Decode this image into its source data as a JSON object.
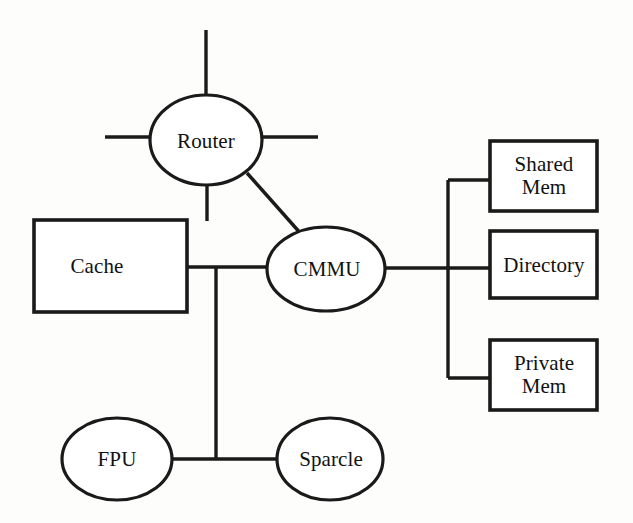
{
  "diagram": {
    "background_color": "#fdfdfc",
    "stroke_color": "#1a1a1a",
    "nodes": [
      {
        "id": "router",
        "label": "Router",
        "shape": "ellipse",
        "cx": 206,
        "cy": 140,
        "rx": 56,
        "ry": 45
      },
      {
        "id": "cmmu",
        "label": "CMMU",
        "shape": "ellipse",
        "cx": 326,
        "cy": 269,
        "rx": 59,
        "ry": 42
      },
      {
        "id": "fpu",
        "label": "FPU",
        "shape": "ellipse",
        "cx": 117,
        "cy": 459,
        "rx": 55,
        "ry": 41
      },
      {
        "id": "sparcle",
        "label": "Sparcle",
        "shape": "ellipse",
        "cx": 330,
        "cy": 459,
        "rx": 53,
        "ry": 41
      },
      {
        "id": "cache",
        "label": "Cache",
        "shape": "rect",
        "x": 34,
        "y": 220,
        "width": 153,
        "height": 92
      },
      {
        "id": "shared-mem",
        "label": "Shared\nMem",
        "shape": "rect",
        "x": 490,
        "y": 141,
        "width": 107,
        "height": 70
      },
      {
        "id": "directory",
        "label": "Directory",
        "shape": "rect",
        "x": 490,
        "y": 231,
        "width": 107,
        "height": 67
      },
      {
        "id": "private-mem",
        "label": "Private\nMem",
        "shape": "rect",
        "x": 490,
        "y": 340,
        "width": 107,
        "height": 70
      }
    ],
    "links": [
      {
        "id": "router-north-spoke",
        "from": "router",
        "to": "network-north",
        "path": "M 206 30 L 206 96"
      },
      {
        "id": "router-west-spoke",
        "from": "router",
        "to": "network-west",
        "path": "M 105 137 L 153 137"
      },
      {
        "id": "router-east-spoke",
        "from": "router",
        "to": "network-east",
        "path": "M 259 137 L 318 137"
      },
      {
        "id": "router-south-spoke",
        "from": "router",
        "to": "network-south",
        "path": "M 207 182 L 207 221"
      },
      {
        "id": "router-cmmu",
        "from": "router",
        "to": "cmmu",
        "path": "M 247 173 L 302 235"
      },
      {
        "id": "cache-cmmu",
        "from": "cache",
        "to": "cmmu",
        "path": "M 187 267 L 268 267"
      },
      {
        "id": "cmmu-bus",
        "from": "cmmu",
        "to": "memory-bus",
        "path": "M 385 268 L 490 268"
      },
      {
        "id": "memory-bus-trunk",
        "from": "memory-bus",
        "to": "memory-bus",
        "path": "M 448 180 L 448 378"
      },
      {
        "id": "bus-shared-mem",
        "from": "memory-bus",
        "to": "shared-mem",
        "path": "M 448 180 L 490 180"
      },
      {
        "id": "bus-private-mem",
        "from": "memory-bus",
        "to": "private-mem",
        "path": "M 448 378 L 490 378"
      },
      {
        "id": "cache-bus-drop",
        "from": "cache",
        "to": "processor-bus",
        "path": "M 216 267 L 216 459"
      },
      {
        "id": "fpu-sparcle",
        "from": "fpu",
        "to": "sparcle",
        "path": "M 171 459 L 279 459"
      }
    ]
  }
}
